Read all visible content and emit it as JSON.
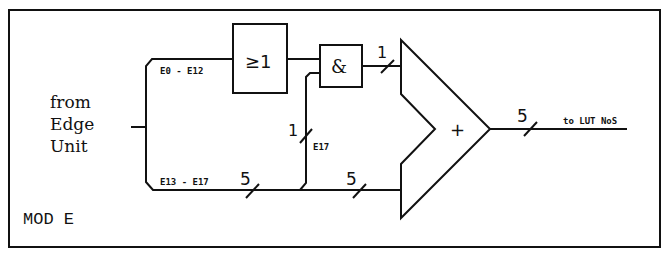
{
  "diagram": {
    "module_label": "MOD E",
    "source_label": [
      "from",
      "Edge",
      "Unit"
    ],
    "or_gate": {
      "label": "≥1"
    },
    "and_gate": {
      "label": "&"
    },
    "adder": {
      "label": "+"
    },
    "bus_labels": {
      "upper": "E0 - E12",
      "lower": "E13 - E17",
      "tap": "E17",
      "output": "to LUT NoS"
    },
    "widths": {
      "and_out": "1",
      "tap": "1",
      "lower_left": "5",
      "lower_right": "5",
      "output": "5"
    }
  }
}
